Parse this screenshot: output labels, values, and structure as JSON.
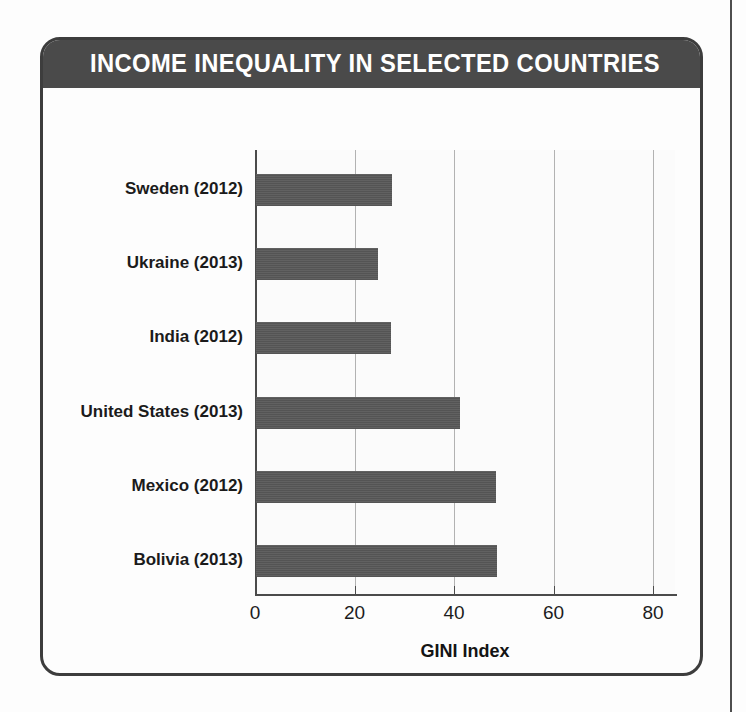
{
  "card": {
    "title": "INCOME INEQUALITY IN SELECTED COUNTRIES",
    "source": "Source: The World Bank, 2016"
  },
  "colors": {
    "title_bar": "#4a4a4a",
    "bar_fill": "#585858",
    "border": "#3d3d3d",
    "gridline": "#b2b2b2",
    "plot_background": "#fbfbfb",
    "title_text": "#ffffff"
  },
  "chart_data": {
    "type": "bar",
    "orientation": "horizontal",
    "title": "INCOME INEQUALITY IN SELECTED COUNTRIES",
    "subtitle": "",
    "xlabel": "GINI Index",
    "ylabel": "",
    "categories": [
      "Sweden (2012)",
      "Ukraine (2013)",
      "India (2012)",
      "United States (2013)",
      "Mexico (2012)",
      "Bolivia (2013)"
    ],
    "values": [
      27.3,
      24.6,
      27.2,
      41.1,
      48.2,
      48.4
    ],
    "xlim": [
      0,
      80
    ],
    "xticks": [
      0,
      20,
      40,
      60,
      80
    ],
    "xtick_labels": [
      "0",
      "20",
      "40",
      "60",
      "80"
    ],
    "grid": "vertical",
    "legend": "none",
    "source": "Source: The World Bank, 2016",
    "series": [
      {
        "name": "GINI Index",
        "values": [
          27.3,
          24.6,
          27.2,
          41.1,
          48.2,
          48.4
        ]
      }
    ]
  }
}
